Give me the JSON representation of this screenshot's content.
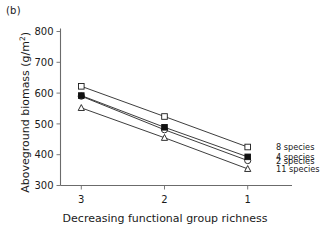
{
  "figure": {
    "panel_label": "(b)"
  },
  "chart_data": {
    "type": "line",
    "title": "",
    "xlabel": "Decreasing functional group richness",
    "ylabel": "Aboveground biomass (g/m2)",
    "ylabel_main": "Aboveground biomass (g/m",
    "ylabel_sup": "2",
    "ylabel_tail": ")",
    "categories": [
      "3",
      "2",
      "1"
    ],
    "x": [
      3,
      2,
      1
    ],
    "xlim": [
      3.25,
      0.75
    ],
    "ylim": [
      300,
      800
    ],
    "yticks": [
      300,
      400,
      500,
      600,
      700,
      800
    ],
    "xticks": [
      "3",
      "2",
      "1"
    ],
    "grid": false,
    "legend_position": "right-of-endpoints",
    "series": [
      {
        "name": "8 species",
        "marker": "open-square",
        "values": [
          622,
          524,
          425
        ]
      },
      {
        "name": "4 species",
        "marker": "filled-square",
        "values": [
          592,
          489,
          393
        ]
      },
      {
        "name": "2 species",
        "marker": "open-circle",
        "values": [
          590,
          481,
          381
        ]
      },
      {
        "name": "11 species",
        "marker": "open-triangle",
        "values": [
          552,
          455,
          354
        ]
      }
    ]
  }
}
